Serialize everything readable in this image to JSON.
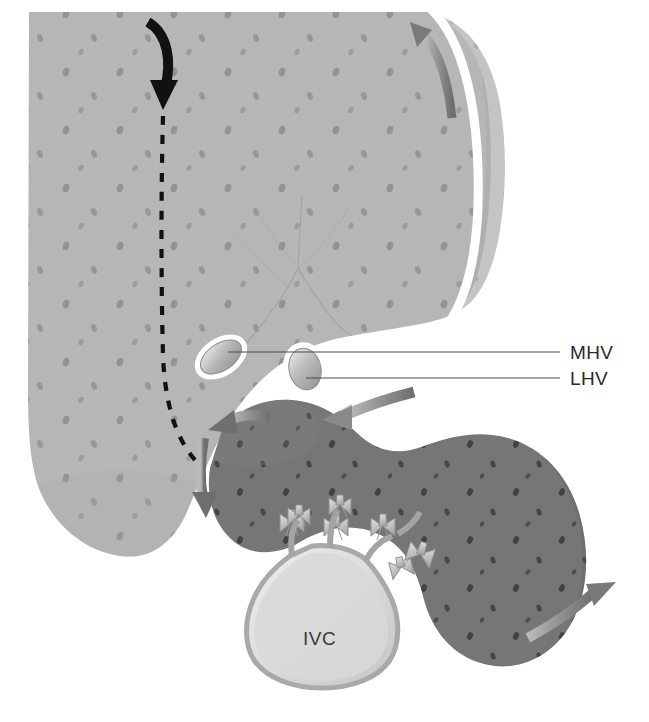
{
  "figure": {
    "type": "anatomical-illustration",
    "background_color": "#ffffff",
    "width": 649,
    "height": 722
  },
  "labels": {
    "mhv": "MHV",
    "lhv": "LHV",
    "ivc": "IVC"
  },
  "colors": {
    "liver_fill": "#b6b6b6",
    "liver_right_strip": "#c2c2c2",
    "caudate_fill": "#767676",
    "ivc_fill": "#d9d9d9",
    "ivc_wall": "#a9a9a9",
    "vessel_rim": "#ffffff",
    "black_arrow": "#111111",
    "gray_arrow": "#8d8d8d",
    "leader_line": "#4a4a4a",
    "label_text": "#2b2b2b",
    "speckle": "#6e6e6e"
  },
  "structures": [
    {
      "name": "liver-parenchyma",
      "label": "Liver parenchyma",
      "shade": "light-gray-speckled"
    },
    {
      "name": "liver-right-lobe-edge",
      "label": "Right lobe edge strip",
      "shade": "light-gray"
    },
    {
      "name": "caudate-lobe",
      "label": "Caudate lobe",
      "shade": "dark-gray-speckled"
    },
    {
      "name": "inferior-vena-cava",
      "label": "Inferior vena cava",
      "shade": "pale-gray"
    },
    {
      "name": "middle-hepatic-vein-stump",
      "label": "Middle hepatic vein cross-section",
      "shade": "white-rimmed-oval"
    },
    {
      "name": "left-hepatic-vein-stump",
      "label": "Left hepatic vein cross-section",
      "shade": "white-rimmed-oval"
    },
    {
      "name": "ligated-vessel-stumps",
      "label": "Ligated short hepatic vein stumps",
      "count": 7
    },
    {
      "name": "portal-branch-tracery",
      "label": "Intrahepatic vein branching tracery"
    }
  ],
  "annotations": {
    "dissection_arrow": {
      "name": "black-dissection-arrow",
      "style": "solid-curved-arrow-down",
      "color": "#111111",
      "description": "Curved black arrow entering from superior liver surface"
    },
    "dissection_plane": {
      "name": "dashed-dissection-plane",
      "style": "dashed-line",
      "color": "#111111",
      "description": "Vertical dashed transection plane through liver"
    },
    "retraction_arrows": [
      {
        "name": "arrow-top-right-up",
        "direction": "up-left",
        "color": "#8d8d8d"
      },
      {
        "name": "arrow-caudate-up-left",
        "direction": "up-left",
        "color": "#8d8d8d"
      },
      {
        "name": "arrow-caudate-down",
        "direction": "down",
        "color": "#8d8d8d"
      },
      {
        "name": "arrow-into-caudate-left",
        "direction": "left",
        "color": "#8d8d8d"
      },
      {
        "name": "arrow-caudate-out-right",
        "direction": "right-up",
        "color": "#8d8d8d"
      }
    ]
  }
}
